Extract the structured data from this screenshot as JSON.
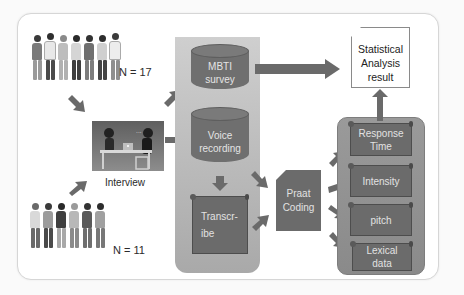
{
  "diagram": {
    "groups": {
      "top_group": {
        "count_label": "N = 17"
      },
      "bottom_group": {
        "count_label": "N = 11"
      }
    },
    "interview": {
      "label": "Interview"
    },
    "data_collection": {
      "mbti": {
        "line1": "MBTI",
        "line2": "survey"
      },
      "voice": {
        "line1": "Voice",
        "line2": "recording"
      },
      "transcribe": {
        "line1": "Transcr-",
        "line2": "ibe"
      }
    },
    "praat": {
      "line1": "Praat",
      "line2": "Coding"
    },
    "features": [
      {
        "line1": "Response",
        "line2": "Time"
      },
      {
        "line1": "Intensity",
        "line2": ""
      },
      {
        "line1": "pitch",
        "line2": ""
      },
      {
        "line1": "Lexical",
        "line2": "data"
      }
    ],
    "result": {
      "line1": "Statistical",
      "line2": "Analysis",
      "line3": "result"
    },
    "colors": {
      "shape_fill": "#6b6b6b",
      "panel_gray": "#b5b5b5",
      "arrow": "#6a6a6a",
      "text_light": "#e2e2e2",
      "text_dark": "#222222"
    }
  }
}
